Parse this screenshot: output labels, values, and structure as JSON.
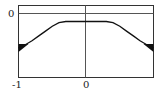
{
  "chart_data": {
    "type": "line",
    "title": "",
    "xlabel": "",
    "ylabel": "",
    "x_ticks": [
      "-1",
      "0"
    ],
    "y_ticks": [
      "0"
    ],
    "xlim": [
      -1,
      1
    ],
    "ylim": [
      -8,
      1
    ],
    "grid": false,
    "reference_lines": [
      {
        "orientation": "horizontal",
        "value": 0
      },
      {
        "orientation": "vertical",
        "value": 0
      }
    ],
    "series": [
      {
        "name": "curve",
        "x": [
          -1.0,
          -0.9,
          -0.8,
          -0.7,
          -0.6,
          -0.5,
          -0.4,
          -0.3,
          -0.2,
          -0.1,
          0.0,
          0.1,
          0.2,
          0.3,
          0.4,
          0.5,
          0.6,
          0.7,
          0.8,
          0.9,
          1.0
        ],
        "y": [
          -4.3,
          -3.9,
          -3.4,
          -2.8,
          -2.2,
          -1.6,
          -1.15,
          -1.0,
          -1.0,
          -1.0,
          -1.0,
          -1.0,
          -1.0,
          -1.0,
          -1.15,
          -1.6,
          -2.2,
          -2.8,
          -3.4,
          -3.9,
          -4.3
        ],
        "noise_band_at_edges": true
      }
    ],
    "legend": null
  },
  "labels": {
    "y_zero": "0",
    "x_min": "-1",
    "x_zero": "0"
  }
}
